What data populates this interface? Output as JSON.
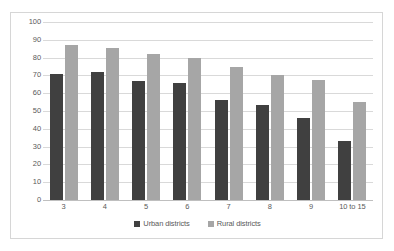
{
  "chart_data": {
    "type": "bar",
    "title": "",
    "xlabel": "",
    "ylabel": "",
    "ylim": [
      0,
      100
    ],
    "ytick_step": 10,
    "yticks": [
      100,
      90,
      80,
      70,
      60,
      50,
      40,
      30,
      20,
      10,
      0
    ],
    "grid": true,
    "legend_position": "bottom",
    "categories": [
      "3",
      "4",
      "5",
      "6",
      "7",
      "8",
      "9",
      "10 to 15"
    ],
    "series": [
      {
        "name": "Urban districts",
        "color": "#404040",
        "values": [
          71,
          72,
          67,
          66,
          56,
          53.5,
          46,
          33
        ]
      },
      {
        "name": "Rural districts",
        "color": "#a6a6a6",
        "values": [
          87,
          85.5,
          82,
          80,
          75,
          70,
          67.5,
          55
        ]
      }
    ]
  },
  "legend": {
    "items": [
      {
        "label": "Urban districts",
        "color": "#404040"
      },
      {
        "label": "Rural districts",
        "color": "#a6a6a6"
      }
    ]
  },
  "colors": {
    "urban": "#404040",
    "rural": "#a6a6a6",
    "gridline": "#d9d9d9",
    "axis": "#bfbfbf",
    "border": "#d6d6d6",
    "text": "#5a5a5a",
    "background": "#ffffff"
  }
}
